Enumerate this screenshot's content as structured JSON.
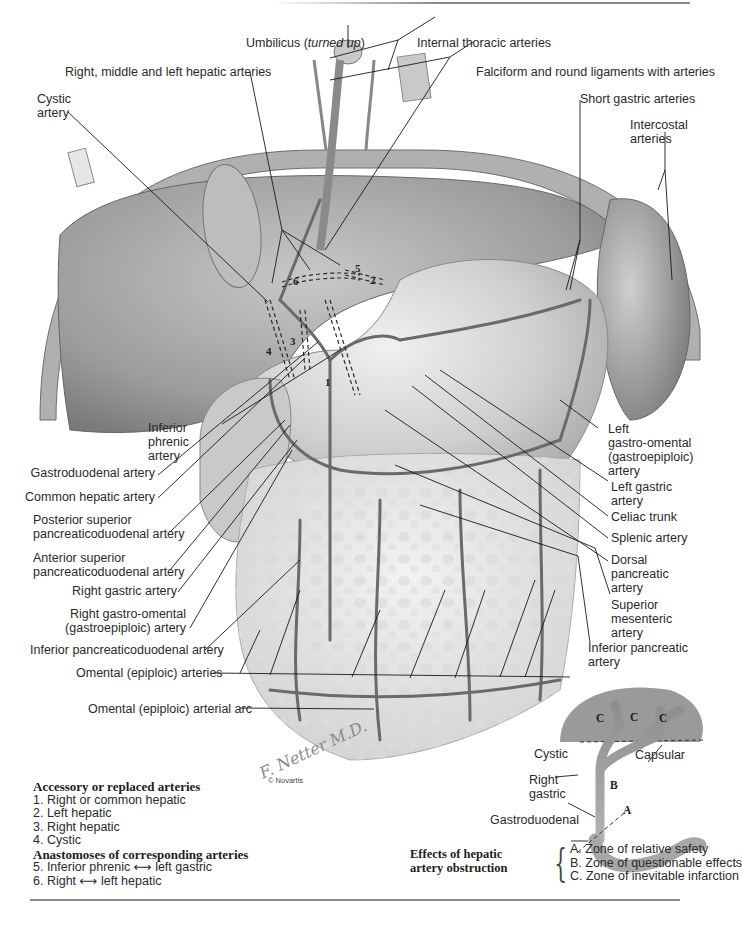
{
  "figure": {
    "type": "anatomical-illustration",
    "signature": "F. Netter M.D.",
    "copyright": "© Novartis"
  },
  "labels_top": {
    "umbilicus": "Umbilicus (",
    "umbilicus_italic": "turned up",
    "umbilicus_close": ")",
    "internal_thoracic": "Internal thoracic arteries",
    "hepatic_branches": "Right, middle and left hepatic arteries",
    "falciform": "Falciform and round ligaments with arteries",
    "cystic_line1": "Cystic",
    "cystic_line2": "artery",
    "short_gastric": "Short gastric arteries",
    "intercostal_line1": "Intercostal",
    "intercostal_line2": "arteries"
  },
  "labels_left": [
    {
      "id": "inferior-phrenic",
      "lines": [
        "Inferior",
        "phrenic",
        "artery"
      ]
    },
    {
      "id": "gastroduodenal",
      "lines": [
        "Gastroduodenal artery"
      ]
    },
    {
      "id": "common-hepatic",
      "lines": [
        "Common hepatic artery"
      ]
    },
    {
      "id": "posterior-superior-pd",
      "lines": [
        "Posterior superior",
        "pancreaticoduodenal artery"
      ]
    },
    {
      "id": "anterior-superior-pd",
      "lines": [
        "Anterior superior",
        "pancreaticoduodenal artery"
      ]
    },
    {
      "id": "right-gastric",
      "lines": [
        "Right gastric artery"
      ]
    },
    {
      "id": "right-gastro-omental",
      "lines": [
        "Right gastro-omental",
        "(gastroepiploic) artery"
      ]
    },
    {
      "id": "inferior-pd",
      "lines": [
        "Inferior pancreaticoduodenal artery"
      ]
    },
    {
      "id": "omental-arteries",
      "lines": [
        "Omental (epiploic) arteries"
      ]
    },
    {
      "id": "omental-arc",
      "lines": [
        "Omental (epiploic) arterial arc"
      ]
    }
  ],
  "labels_right": [
    {
      "id": "left-gastro-omental",
      "lines": [
        "Left",
        "gastro-omental",
        "(gastroepiploic)",
        "artery"
      ]
    },
    {
      "id": "left-gastric",
      "lines": [
        "Left gastric",
        "artery"
      ]
    },
    {
      "id": "celiac-trunk",
      "lines": [
        "Celiac trunk"
      ]
    },
    {
      "id": "splenic",
      "lines": [
        "Splenic artery"
      ]
    },
    {
      "id": "dorsal-pancreatic",
      "lines": [
        "Dorsal",
        "pancreatic",
        "artery"
      ]
    },
    {
      "id": "superior-mesenteric",
      "lines": [
        "Superior",
        "mesenteric",
        "artery"
      ]
    },
    {
      "id": "inferior-pancreatic",
      "lines": [
        "Inferior pancreatic",
        "artery"
      ]
    }
  ],
  "numbered_markers": [
    "1",
    "2",
    "3",
    "4",
    "5",
    "6"
  ],
  "legend": {
    "heading1": "Accessory or replaced arteries",
    "items1": [
      "1. Right or common hepatic",
      "2. Left hepatic",
      "3. Right hepatic",
      "4. Cystic"
    ],
    "heading2": "Anastomoses of corresponding arteries",
    "items2": [
      {
        "pre": "5. Inferior phrenic ",
        "arrow": "⟷",
        "post": " left gastric"
      },
      {
        "pre": "6. Right ",
        "arrow": "⟷",
        "post": " left hepatic"
      }
    ]
  },
  "inset": {
    "zones_c": [
      "C",
      "C",
      "C"
    ],
    "zone_b": "B",
    "zone_a": "A",
    "cystic": "Cystic",
    "capsular": "Capsular",
    "right_gastric_line1": "Right",
    "right_gastric_line2": "gastric",
    "gastroduodenal": "Gastroduodenal"
  },
  "effects": {
    "heading_line1": "Effects of hepatic",
    "heading_line2": "artery obstruction",
    "brace": "{",
    "items": [
      "A. Zone of relative safety",
      "B. Zone of questionable effects",
      "C. Zone of inevitable infarction"
    ]
  },
  "colors": {
    "ink": "#2a2a2a",
    "leader": "#1a1a1a",
    "organ_dark": "#6e6e6e",
    "organ_mid": "#a4a4a4",
    "organ_light": "#d6d6d6",
    "omentum": "#e2e2e2",
    "rule": "#8c8c8c"
  }
}
